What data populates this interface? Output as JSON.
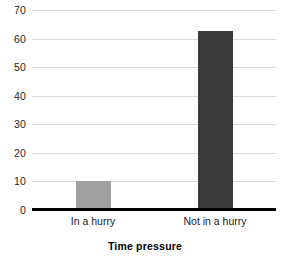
{
  "chart_data": {
    "type": "bar",
    "title": "",
    "xlabel": "Time pressure",
    "ylabel": "",
    "categories": [
      "In a hurry",
      "Not in a hurry"
    ],
    "values": [
      10,
      62.5
    ],
    "ylim": [
      0,
      70
    ],
    "yticks": [
      70,
      60,
      50,
      40,
      30,
      20,
      10,
      0
    ],
    "ytick_labels": [
      "70",
      "60",
      "50",
      "40",
      "30",
      "20",
      "10",
      "0"
    ],
    "grid": true,
    "legend": "none",
    "bar_colors": [
      "#a0a0a0",
      "#3a3a3a"
    ],
    "axis_line_color": "#000000",
    "gridline_color": "#d9d9d9",
    "background_color": "#ffffff"
  }
}
